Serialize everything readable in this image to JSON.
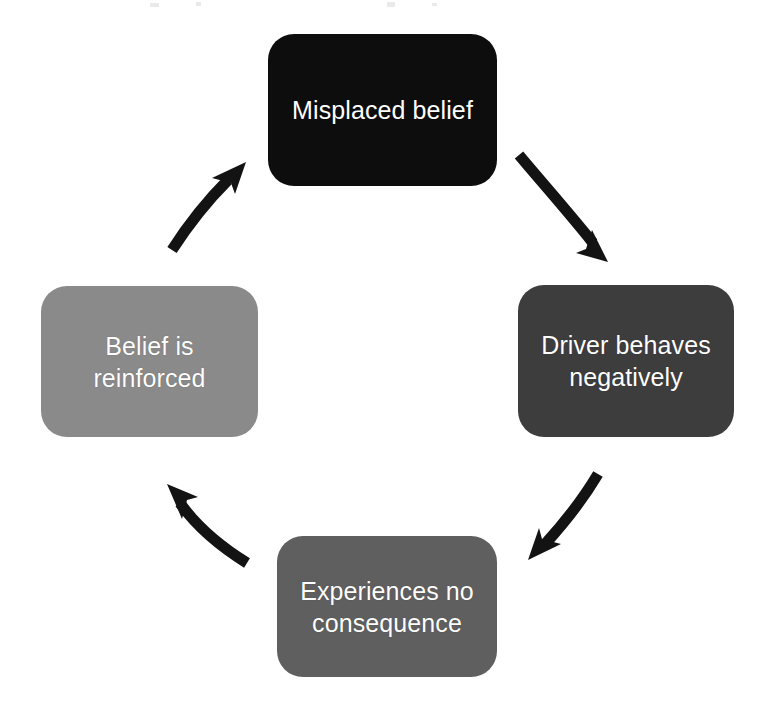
{
  "diagram": {
    "type": "cycle-flowchart",
    "direction": "clockwise",
    "background_color": "#ffffff",
    "nodes": [
      {
        "id": "misplaced-belief",
        "label": "Misplaced belief",
        "position": "top",
        "fill_color": "#0d0d0d",
        "text_color": "#ffffff",
        "lines": 1
      },
      {
        "id": "driver-behaves-negatively",
        "label": "Driver behaves\nnegatively",
        "position": "right",
        "fill_color": "#3d3d3d",
        "text_color": "#ffffff",
        "lines": 2
      },
      {
        "id": "experiences-no-consequence",
        "label": "Experiences no\nconsequence",
        "position": "bottom",
        "fill_color": "#5f5f5f",
        "text_color": "#ffffff",
        "lines": 2
      },
      {
        "id": "belief-is-reinforced",
        "label": "Belief is\nreinforced",
        "position": "left",
        "fill_color": "#8a8a8a",
        "text_color": "#ffffff",
        "lines": 2
      }
    ],
    "connectors": [
      {
        "id": "arrow-top-to-right",
        "from": "misplaced-belief",
        "to": "driver-behaves-negatively",
        "shape": "curved",
        "direction": "down-right",
        "color": "#131313"
      },
      {
        "id": "arrow-right-to-bottom",
        "from": "driver-behaves-negatively",
        "to": "experiences-no-consequence",
        "shape": "curved",
        "direction": "down-left",
        "color": "#131313"
      },
      {
        "id": "arrow-bottom-to-left",
        "from": "experiences-no-consequence",
        "to": "belief-is-reinforced",
        "shape": "curved",
        "direction": "up-left",
        "color": "#131313"
      },
      {
        "id": "arrow-left-to-top",
        "from": "belief-is-reinforced",
        "to": "misplaced-belief",
        "shape": "curved",
        "direction": "up-right",
        "color": "#131313"
      }
    ]
  }
}
